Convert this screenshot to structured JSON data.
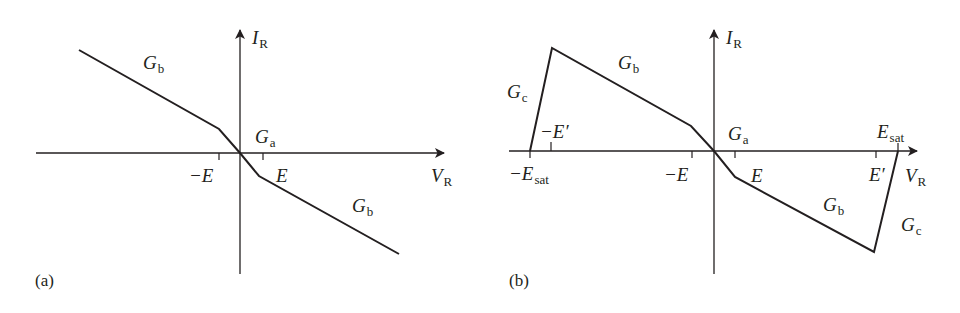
{
  "panel_a": {
    "caption": "(a)",
    "axis_y": {
      "main": "I",
      "sub": "R"
    },
    "axis_x": {
      "main": "V",
      "sub": "R"
    },
    "labels": {
      "gb_upper": {
        "main": "G",
        "sub": "b"
      },
      "ga": {
        "main": "G",
        "sub": "a"
      },
      "gb_lower": {
        "main": "G",
        "sub": "b"
      },
      "neg_e": "−E",
      "pos_e": "E"
    }
  },
  "panel_b": {
    "caption": "(b)",
    "axis_y": {
      "main": "I",
      "sub": "R"
    },
    "axis_x": {
      "main": "V",
      "sub": "R"
    },
    "labels": {
      "gc_left": {
        "main": "G",
        "sub": "c"
      },
      "gb_upper": {
        "main": "G",
        "sub": "b"
      },
      "ga": {
        "main": "G",
        "sub": "a"
      },
      "gb_lower": {
        "main": "G",
        "sub": "b"
      },
      "gc_right": {
        "main": "G",
        "sub": "c"
      },
      "neg_e_prime": "−E′",
      "neg_e_sat": {
        "main": "−E",
        "sub": "sat"
      },
      "neg_e": "−E",
      "pos_e": "E",
      "e_prime": "E′",
      "e_sat": {
        "main": "E",
        "sub": "sat"
      }
    }
  },
  "colors": {
    "ink": "#231f20",
    "background": "#ffffff"
  }
}
